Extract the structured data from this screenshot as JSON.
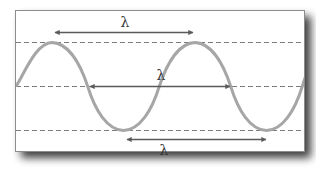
{
  "diagram": {
    "labels": {
      "top": "λ",
      "middle": "λ",
      "bottom": "λ"
    },
    "annotations": [
      {
        "id": "top",
        "label": "λ",
        "from": "crest",
        "to": "crest"
      },
      {
        "id": "middle",
        "label": "λ",
        "from": "midline crossing",
        "to": "midline crossing"
      },
      {
        "id": "bottom",
        "label": "λ",
        "from": "trough",
        "to": "trough"
      }
    ],
    "colors": {
      "wave": "#a6a6a6",
      "arrow": "#5a5a5a",
      "dashed_line": "#7a7a7a",
      "frame": "#8c8c8c",
      "background": "#ffffff",
      "shadow": "#555555"
    },
    "reference_lines": [
      "crest",
      "midline",
      "trough"
    ]
  }
}
